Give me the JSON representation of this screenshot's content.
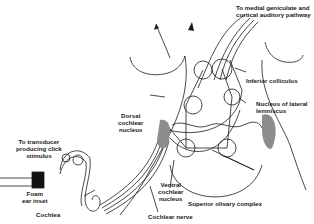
{
  "diagram": {
    "labels": {
      "top": [
        "To medial geniculate and",
        "cortical auditory pathway"
      ],
      "inferior_colliculus": "Inferior colliculus",
      "lateral_lemniscus": [
        "Nucleus of lateral",
        "lemniscus"
      ],
      "dorsal_cochlear": [
        "Dorsal",
        "cochlear",
        "nucleus"
      ],
      "transducer": [
        "To transducer",
        "producing click",
        "stimulus"
      ],
      "foam": [
        "Foam",
        "ear inset"
      ],
      "cochlea": "Cochlea",
      "ventral_cochlear": [
        "Ventral",
        "cochlear",
        "nucleus"
      ],
      "superior_olivary": "Superior olivary complex",
      "cochlear_nerve": "Cochlear nerve"
    },
    "colors": {
      "line": "#1a1a1a",
      "shade": "#8c8c8c",
      "plug": "#111111"
    }
  }
}
